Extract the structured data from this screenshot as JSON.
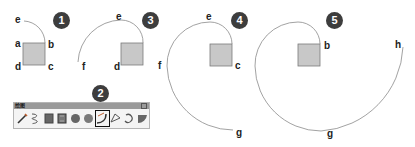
{
  "figure": {
    "panels": [
      {
        "step": "1",
        "labels": {
          "e": "e",
          "a": "a",
          "b": "b",
          "c": "c",
          "d": "d"
        }
      },
      {
        "step": "3",
        "labels": {
          "e": "e",
          "f": "f",
          "d": "d"
        }
      },
      {
        "step": "4",
        "labels": {
          "e": "e",
          "f": "f",
          "c": "c",
          "g": "g"
        }
      },
      {
        "step": "5",
        "labels": {
          "b": "b",
          "h": "h",
          "g": "g"
        }
      }
    ],
    "toolbar": {
      "step": "2",
      "title": "绘图",
      "tools": [
        {
          "name": "line-tool",
          "active": false
        },
        {
          "name": "freehand-tool",
          "active": false
        },
        {
          "name": "rectangle-tool",
          "active": false
        },
        {
          "name": "rotated-rectangle-tool",
          "active": false
        },
        {
          "name": "circle-tool",
          "active": false
        },
        {
          "name": "polygon-tool",
          "active": false
        },
        {
          "name": "arc-tool",
          "active": true
        },
        {
          "name": "two-point-arc-tool",
          "active": false
        },
        {
          "name": "three-point-arc-tool",
          "active": false
        },
        {
          "name": "pie-tool",
          "active": false
        }
      ]
    },
    "colors": {
      "square_fill": "#c8c8c8",
      "square_stroke": "#7a7a7a",
      "arc_stroke": "#8a8a8a",
      "badge": "#3d3d3d",
      "toolbar_title": "#9a9a9a"
    }
  }
}
